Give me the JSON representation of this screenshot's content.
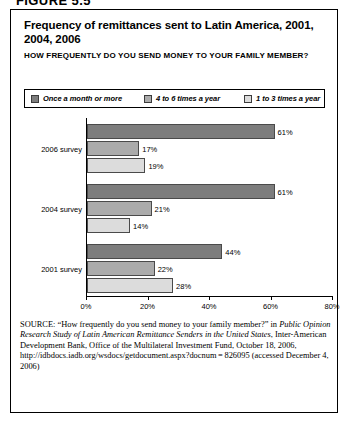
{
  "figure_label": "FIGURE 5.5",
  "chart": {
    "title": "Frequency of remittances sent to Latin America, 2001, 2004, 2006",
    "subtitle": "HOW FREQUENTLY DO YOU SEND MONEY TO YOUR FAMILY MEMBER?"
  },
  "legend": {
    "items": [
      {
        "label": "Once a month or more",
        "color": "#7d7d7d"
      },
      {
        "label": "4 to 6 times a year",
        "color": "#ababab"
      },
      {
        "label": "1 to 3 times a year",
        "color": "#dcdcdc"
      }
    ]
  },
  "axis": {
    "ticks": [
      "0%",
      "20%",
      "40%",
      "60%",
      "80%"
    ]
  },
  "groups": [
    {
      "label": "2006 survey",
      "bars": [
        {
          "value": 61,
          "display": "61%"
        },
        {
          "value": 17,
          "display": "17%"
        },
        {
          "value": 19,
          "display": "19%"
        }
      ]
    },
    {
      "label": "2004 survey",
      "bars": [
        {
          "value": 61,
          "display": "61%"
        },
        {
          "value": 21,
          "display": "21%"
        },
        {
          "value": 14,
          "display": "14%"
        }
      ]
    },
    {
      "label": "2001 survey",
      "bars": [
        {
          "value": 44,
          "display": "44%"
        },
        {
          "value": 22,
          "display": "22%"
        },
        {
          "value": 28,
          "display": "28%"
        }
      ]
    }
  ],
  "source": {
    "prefix": "SOURCE",
    "line1": ": “How frequently do you send money to your family member?” in ",
    "italic1": "Public Opinion Research Study of Latin American Remittance Senders in the United States",
    "line2": ", Inter-American Development Bank, Office of the Multilateral Investment Fund, October 18, 2006, http://idbdocs.iadb.org/wsdocs/getdocument.aspx?docnum = 826095 (accessed December 4, 2006)"
  },
  "chart_data": {
    "type": "bar",
    "orientation": "horizontal",
    "title": "Frequency of remittances sent to Latin America, 2001, 2004, 2006",
    "subtitle": "HOW FREQUENTLY DO YOU SEND MONEY TO YOUR FAMILY MEMBER?",
    "xlabel": "",
    "ylabel": "",
    "xlim": [
      0,
      80
    ],
    "xticks": [
      0,
      20,
      40,
      60,
      80
    ],
    "xtick_labels": [
      "0%",
      "20%",
      "40%",
      "60%",
      "80%"
    ],
    "grid": false,
    "legend_position": "top",
    "categories": [
      "2006 survey",
      "2004 survey",
      "2001 survey"
    ],
    "series": [
      {
        "name": "Once a month or more",
        "color": "#7d7d7d",
        "values": [
          61,
          61,
          44
        ]
      },
      {
        "name": "4 to 6 times a year",
        "color": "#ababab",
        "values": [
          17,
          21,
          22
        ]
      },
      {
        "name": "1 to 3 times a year",
        "color": "#dcdcdc",
        "values": [
          19,
          14,
          28
        ]
      }
    ],
    "data_labels": [
      "61%",
      "17%",
      "19%",
      "61%",
      "21%",
      "14%",
      "44%",
      "22%",
      "28%"
    ],
    "units": "percent"
  }
}
